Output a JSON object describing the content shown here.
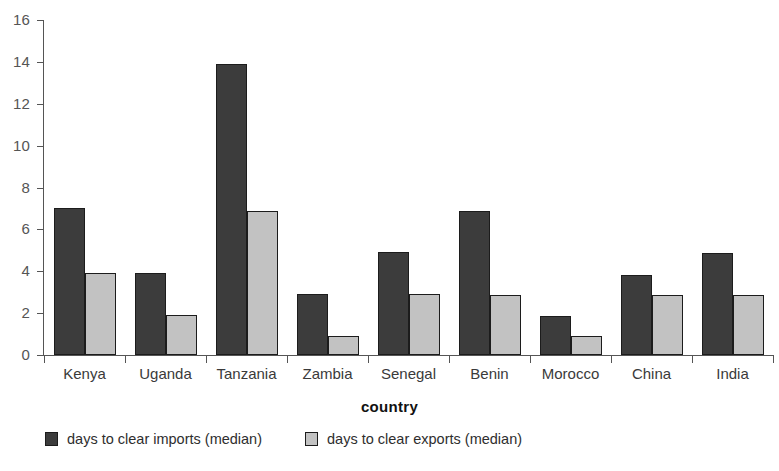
{
  "chart_data": {
    "type": "bar",
    "title": "",
    "subtitle": "",
    "xlabel": "country",
    "ylabel": "",
    "categories": [
      "Kenya",
      "Uganda",
      "Tanzania",
      "Zambia",
      "Senegal",
      "Benin",
      "Morocco",
      "China",
      "India"
    ],
    "series": [
      {
        "name": "days to clear imports (median)",
        "color": "#3c3c3c",
        "values": [
          7.0,
          3.9,
          13.9,
          2.9,
          4.9,
          6.9,
          1.85,
          3.8,
          4.85
        ]
      },
      {
        "name": "days to clear exports (median)",
        "color": "#c2c2c2",
        "values": [
          3.9,
          1.9,
          6.9,
          0.9,
          2.9,
          2.85,
          0.9,
          2.85,
          2.85
        ]
      }
    ],
    "ylim": [
      0,
      16
    ],
    "ytick_values": [
      0,
      2,
      4,
      6,
      8,
      10,
      12,
      14,
      16
    ],
    "ytick_labels": [
      "0",
      "2",
      "4",
      "6",
      "8",
      "10",
      "12",
      "14",
      "16"
    ],
    "grid": false,
    "legend_position": "bottom-left",
    "axis_color": "#555555",
    "bar_edge_color": "#1c1c1c",
    "background_color": "#ffffff"
  },
  "axes": {
    "x_title": "country"
  },
  "legend": {
    "entries": [
      {
        "label": "days to clear imports (median)",
        "swatch": "imports"
      },
      {
        "label": "days to clear exports (median)",
        "swatch": "exports"
      }
    ]
  }
}
